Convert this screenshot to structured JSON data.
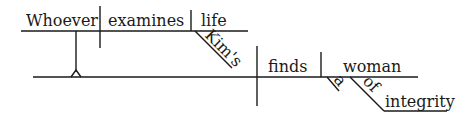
{
  "diagram": {
    "type": "sentence-diagram",
    "sentence_words": {
      "subject_clause_subject": "Whoever",
      "subject_clause_verb": "examines",
      "subject_clause_object": "life",
      "object_modifier": "Kim's",
      "verb": "finds",
      "direct_object": "woman",
      "article": "a",
      "preposition": "of",
      "prepositional_object": "integrity"
    },
    "line_color": "#1a1a1a"
  }
}
